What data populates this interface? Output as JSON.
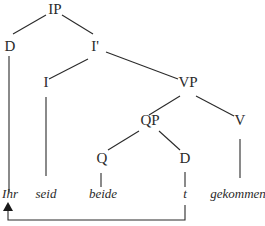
{
  "diagram": {
    "type": "syntax-tree",
    "nodes": {
      "ip": "IP",
      "d_top": "D",
      "ibar": "I'",
      "i": "I",
      "vp": "VP",
      "qp": "QP",
      "v": "V",
      "q": "Q",
      "d_low": "D"
    },
    "leaves": {
      "ihr": "Ihr",
      "seid": "seid",
      "beide": "beide",
      "t": "t",
      "gekommen": "gekommen"
    },
    "movement": {
      "from": "t",
      "to": "Ihr",
      "style": "arrow"
    }
  }
}
